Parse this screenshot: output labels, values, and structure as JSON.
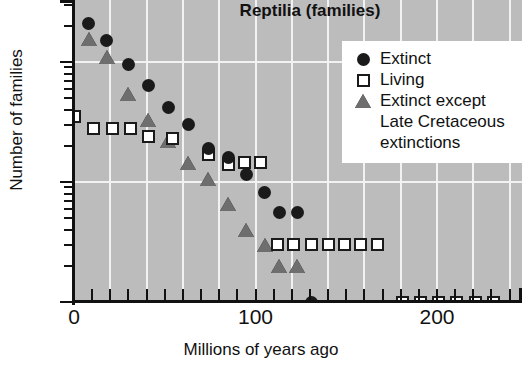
{
  "chart_data": {
    "type": "scatter",
    "title": "Reptilia (families)",
    "xlabel": "Millions of years ago",
    "ylabel": "Number of families",
    "xlim": [
      0,
      247
    ],
    "ylim": [
      1,
      300
    ],
    "yscale": "log",
    "xscale": "linear",
    "grid": true,
    "x_ticks_major": [
      0,
      100,
      200
    ],
    "x_tick_labels": [
      "0",
      "100",
      "200"
    ],
    "x_ticks_minor": [
      10,
      20,
      30,
      40,
      50,
      60,
      70,
      80,
      90,
      110,
      120,
      130,
      140,
      150,
      160,
      170,
      180,
      190,
      210,
      220,
      230,
      240
    ],
    "y_ticks_major": [
      1,
      10,
      100
    ],
    "y_tick_labels": [
      "1",
      "10",
      "100"
    ],
    "y_ticks_minor": [
      2,
      3,
      4,
      5,
      6,
      7,
      8,
      9,
      20,
      30,
      40,
      50,
      60,
      70,
      80,
      90,
      200,
      300
    ],
    "legend_position": "top-right",
    "plot_bg_color": "#bcbcbc",
    "grid_color": "#f2f2f2",
    "series": [
      {
        "name": "Extinct",
        "marker": "filled-circle",
        "color": "#1a1a1a",
        "points": [
          {
            "x": 8,
            "y": 208
          },
          {
            "x": 18,
            "y": 150
          },
          {
            "x": 30,
            "y": 95
          },
          {
            "x": 41,
            "y": 64
          },
          {
            "x": 52,
            "y": 42
          },
          {
            "x": 63,
            "y": 30
          },
          {
            "x": 74,
            "y": 19
          },
          {
            "x": 85,
            "y": 16
          },
          {
            "x": 95,
            "y": 11.5
          },
          {
            "x": 105,
            "y": 8.2
          },
          {
            "x": 113,
            "y": 5.6
          },
          {
            "x": 123,
            "y": 5.6
          },
          {
            "x": 131,
            "y": 1
          }
        ]
      },
      {
        "name": "Living",
        "marker": "open-square",
        "color": "#ffffff",
        "edge_color": "#1a1a1a",
        "points": [
          {
            "x": 0,
            "y": 35
          },
          {
            "x": 11,
            "y": 28
          },
          {
            "x": 21,
            "y": 28
          },
          {
            "x": 31,
            "y": 28
          },
          {
            "x": 41,
            "y": 24
          },
          {
            "x": 54,
            "y": 23
          },
          {
            "x": 74,
            "y": 17
          },
          {
            "x": 85,
            "y": 14
          },
          {
            "x": 94,
            "y": 14.5
          },
          {
            "x": 103,
            "y": 14.5
          },
          {
            "x": 112,
            "y": 3
          },
          {
            "x": 121,
            "y": 3
          },
          {
            "x": 131,
            "y": 3
          },
          {
            "x": 140,
            "y": 3
          },
          {
            "x": 149,
            "y": 3
          },
          {
            "x": 158,
            "y": 3
          },
          {
            "x": 167,
            "y": 3
          },
          {
            "x": 181,
            "y": 1
          },
          {
            "x": 191,
            "y": 1
          },
          {
            "x": 201,
            "y": 1
          },
          {
            "x": 211,
            "y": 1
          },
          {
            "x": 221,
            "y": 1
          },
          {
            "x": 231,
            "y": 1
          }
        ]
      },
      {
        "name": "Extinct except Late Cretaceous extinctions",
        "marker": "filled-triangle",
        "color": "#6e6e6e",
        "points": [
          {
            "x": 8,
            "y": 155
          },
          {
            "x": 18,
            "y": 110
          },
          {
            "x": 30,
            "y": 54
          },
          {
            "x": 41,
            "y": 33
          },
          {
            "x": 52,
            "y": 22
          },
          {
            "x": 63,
            "y": 14.5
          },
          {
            "x": 74,
            "y": 10.5
          },
          {
            "x": 85,
            "y": 6.6
          },
          {
            "x": 95,
            "y": 4
          },
          {
            "x": 105,
            "y": 3
          },
          {
            "x": 113,
            "y": 2
          },
          {
            "x": 123,
            "y": 2
          }
        ]
      }
    ]
  },
  "legend": {
    "entries": [
      {
        "label": "Extinct",
        "symbol": "filled-circle",
        "continuation": []
      },
      {
        "label": "Living",
        "symbol": "open-square",
        "continuation": []
      },
      {
        "label": "Extinct except",
        "symbol": "filled-triangle",
        "continuation": [
          "Late Cretaceous",
          "extinctions"
        ]
      }
    ]
  }
}
